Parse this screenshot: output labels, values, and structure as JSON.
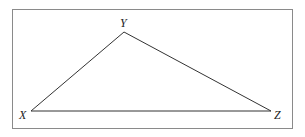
{
  "figure": {
    "type": "triangle",
    "border_color": "#8a8a8a",
    "line_color": "#333333",
    "vertices": [
      {
        "label": "X",
        "x": 31,
        "y": 111
      },
      {
        "label": "Y",
        "x": 124,
        "y": 32
      },
      {
        "label": "Z",
        "x": 271,
        "y": 111
      }
    ],
    "labels": {
      "x": "X",
      "y": "Y",
      "z": "Z"
    }
  }
}
